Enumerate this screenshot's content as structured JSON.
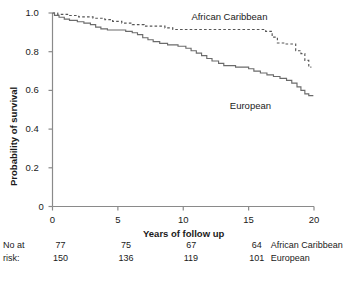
{
  "chart_data": {
    "type": "line",
    "title": "",
    "xlabel": "Years of follow up",
    "ylabel": "Probability of survival",
    "xlim": [
      0,
      20
    ],
    "ylim": [
      0,
      1.0
    ],
    "grid": false,
    "legend_position": "inline-right",
    "xticks": [
      0,
      5,
      10,
      15,
      20
    ],
    "xtick_labels": [
      "0",
      "5",
      "10",
      "15",
      "20"
    ],
    "yticks": [
      0,
      0.2,
      0.4,
      0.6,
      0.8,
      1.0
    ],
    "ytick_labels": [
      "0",
      "0.2",
      "0.4",
      "0.6",
      "0.8",
      "1.0"
    ],
    "series": [
      {
        "name": "African Caribbean",
        "style": "dashed",
        "color": "#555555",
        "label_x": 14.1,
        "label_y": 0.975,
        "points": [
          [
            0.0,
            1.0
          ],
          [
            0.4,
            1.0
          ],
          [
            0.4,
            0.993
          ],
          [
            1.2,
            0.993
          ],
          [
            1.2,
            0.987
          ],
          [
            2.0,
            0.987
          ],
          [
            2.0,
            0.98
          ],
          [
            3.1,
            0.98
          ],
          [
            3.1,
            0.973
          ],
          [
            4.0,
            0.973
          ],
          [
            4.0,
            0.966
          ],
          [
            4.6,
            0.966
          ],
          [
            4.6,
            0.957
          ],
          [
            5.3,
            0.957
          ],
          [
            5.3,
            0.948
          ],
          [
            6.1,
            0.948
          ],
          [
            6.1,
            0.94
          ],
          [
            7.0,
            0.94
          ],
          [
            7.0,
            0.932
          ],
          [
            8.6,
            0.932
          ],
          [
            8.6,
            0.923
          ],
          [
            9.2,
            0.923
          ],
          [
            9.2,
            0.915
          ],
          [
            13.0,
            0.915
          ],
          [
            13.0,
            0.915
          ],
          [
            16.3,
            0.915
          ],
          [
            16.3,
            0.905
          ],
          [
            16.8,
            0.905
          ],
          [
            16.8,
            0.875
          ],
          [
            17.2,
            0.875
          ],
          [
            17.2,
            0.845
          ],
          [
            17.8,
            0.845
          ],
          [
            17.8,
            0.84
          ],
          [
            18.6,
            0.84
          ],
          [
            18.6,
            0.805
          ],
          [
            19.0,
            0.805
          ],
          [
            19.0,
            0.79
          ],
          [
            19.3,
            0.79
          ],
          [
            19.3,
            0.755
          ],
          [
            19.6,
            0.755
          ],
          [
            19.6,
            0.72
          ],
          [
            19.8,
            0.72
          ]
        ]
      },
      {
        "name": "European",
        "style": "solid",
        "color": "#6b6b6b",
        "label_x": 15.2,
        "label_y": 0.513,
        "points": [
          [
            0.0,
            1.0
          ],
          [
            0.15,
            1.0
          ],
          [
            0.15,
            0.988
          ],
          [
            0.5,
            0.988
          ],
          [
            0.5,
            0.978
          ],
          [
            0.9,
            0.978
          ],
          [
            0.9,
            0.968
          ],
          [
            1.3,
            0.968
          ],
          [
            1.3,
            0.962
          ],
          [
            1.9,
            0.962
          ],
          [
            1.9,
            0.955
          ],
          [
            2.4,
            0.955
          ],
          [
            2.4,
            0.948
          ],
          [
            2.9,
            0.948
          ],
          [
            2.9,
            0.94
          ],
          [
            3.3,
            0.94
          ],
          [
            3.3,
            0.927
          ],
          [
            3.7,
            0.927
          ],
          [
            3.7,
            0.918
          ],
          [
            4.2,
            0.918
          ],
          [
            4.2,
            0.912
          ],
          [
            5.6,
            0.912
          ],
          [
            5.6,
            0.905
          ],
          [
            6.1,
            0.905
          ],
          [
            6.1,
            0.898
          ],
          [
            6.5,
            0.898
          ],
          [
            6.5,
            0.888
          ],
          [
            6.9,
            0.888
          ],
          [
            6.9,
            0.872
          ],
          [
            7.3,
            0.872
          ],
          [
            7.3,
            0.862
          ],
          [
            7.7,
            0.862
          ],
          [
            7.7,
            0.852
          ],
          [
            8.2,
            0.852
          ],
          [
            8.2,
            0.843
          ],
          [
            8.8,
            0.843
          ],
          [
            8.8,
            0.835
          ],
          [
            9.6,
            0.835
          ],
          [
            9.6,
            0.828
          ],
          [
            10.2,
            0.828
          ],
          [
            10.2,
            0.818
          ],
          [
            10.6,
            0.818
          ],
          [
            10.6,
            0.805
          ],
          [
            11.0,
            0.805
          ],
          [
            11.0,
            0.793
          ],
          [
            11.4,
            0.793
          ],
          [
            11.4,
            0.78
          ],
          [
            11.8,
            0.78
          ],
          [
            11.8,
            0.765
          ],
          [
            12.2,
            0.765
          ],
          [
            12.2,
            0.752
          ],
          [
            12.7,
            0.752
          ],
          [
            12.7,
            0.74
          ],
          [
            13.1,
            0.74
          ],
          [
            13.1,
            0.728
          ],
          [
            14.0,
            0.728
          ],
          [
            14.0,
            0.72
          ],
          [
            15.0,
            0.72
          ],
          [
            15.0,
            0.712
          ],
          [
            15.4,
            0.712
          ],
          [
            15.4,
            0.7
          ],
          [
            15.9,
            0.7
          ],
          [
            15.9,
            0.69
          ],
          [
            16.4,
            0.69
          ],
          [
            16.4,
            0.68
          ],
          [
            16.9,
            0.68
          ],
          [
            16.9,
            0.672
          ],
          [
            17.4,
            0.672
          ],
          [
            17.4,
            0.662
          ],
          [
            17.9,
            0.662
          ],
          [
            17.9,
            0.652
          ],
          [
            18.3,
            0.652
          ],
          [
            18.3,
            0.638
          ],
          [
            18.7,
            0.638
          ],
          [
            18.7,
            0.618
          ],
          [
            19.0,
            0.618
          ],
          [
            19.0,
            0.6
          ],
          [
            19.3,
            0.6
          ],
          [
            19.3,
            0.582
          ],
          [
            19.6,
            0.582
          ],
          [
            19.6,
            0.573
          ],
          [
            19.95,
            0.573
          ]
        ]
      }
    ],
    "risk_table": {
      "header_line1": "No at",
      "header_line2": "risk:",
      "time_points": [
        0,
        5,
        10,
        15
      ],
      "rows": [
        {
          "group": "African Caribbean",
          "counts": [
            "77",
            "75",
            "67",
            "64"
          ]
        },
        {
          "group": "European",
          "counts": [
            "150",
            "136",
            "119",
            "101"
          ]
        }
      ]
    }
  }
}
